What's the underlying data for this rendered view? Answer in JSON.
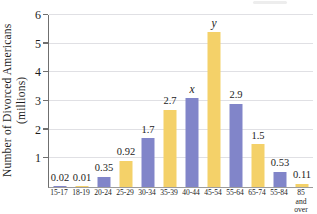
{
  "chart_data": {
    "type": "bar",
    "title": "",
    "ylabel": "Number of Divorced Americans\n(millions)",
    "xlabel": "",
    "categories": [
      "15-17",
      "18-19",
      "20-24",
      "25-29",
      "30-34",
      "35-39",
      "40-44",
      "45-54",
      "55-64",
      "65-74",
      "55-84",
      "85\nand over"
    ],
    "values": [
      0.02,
      0.01,
      0.35,
      0.92,
      1.7,
      2.7,
      3.1,
      5.4,
      2.9,
      1.5,
      0.53,
      0.11
    ],
    "bar_value_labels": [
      "0.02",
      "0.01",
      "0.35",
      "0.92",
      "1.7",
      "2.7",
      "x",
      "y",
      "2.9",
      "1.5",
      "0.53",
      "0.11"
    ],
    "letter_labels": [
      "x",
      "y"
    ],
    "y_ticks": [
      1,
      2,
      3,
      4,
      5,
      6
    ],
    "ylim": [
      0,
      6
    ],
    "grid": true,
    "legend_position": "none",
    "colors": {
      "bar_alternating": [
        "#8185c9",
        "#f4d169"
      ],
      "gridline": "#e0e0e4",
      "y_axis": "#6f6f6f",
      "x_axis": "#9b9b9b",
      "text": "#1c1c1c",
      "background": "#ffffff"
    }
  }
}
